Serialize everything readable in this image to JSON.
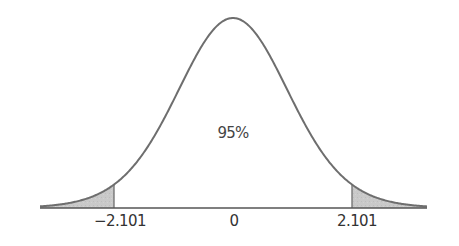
{
  "chart_data": {
    "type": "area",
    "title": "",
    "subtitle": "",
    "xlabel": "",
    "ylabel": "",
    "distribution": "t (symmetric bell curve)",
    "center_annotation": "95%",
    "tick_labels": [
      "-2.101",
      "0",
      "2.101"
    ],
    "tick_values": [
      -2.101,
      0,
      2.101
    ],
    "critical_values": {
      "lower": -2.101,
      "upper": 2.101
    },
    "central_area": 0.95,
    "tail_areas": {
      "left": 0.025,
      "right": 0.025
    },
    "shaded_regions": [
      {
        "name": "left-tail",
        "from": "-inf",
        "to": -2.101
      },
      {
        "name": "right-tail",
        "from": 2.101,
        "to": "inf"
      }
    ],
    "grid": false,
    "legend": "none",
    "colors": {
      "curve": "#6e6e6e",
      "shade": "#c8c8c8",
      "axis": "#555555",
      "text": "#333333"
    }
  },
  "labels": {
    "center": "95%",
    "ticks": {
      "left": "−2.101",
      "center": "0",
      "right": "2.101"
    }
  }
}
